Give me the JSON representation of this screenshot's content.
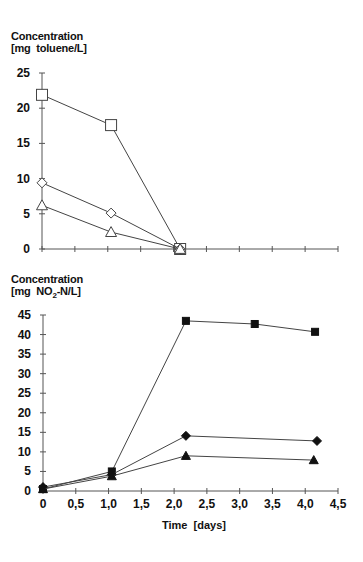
{
  "chart_data": [
    {
      "type": "line",
      "title": "",
      "ylabel": "Concentration [mg toluene/L]",
      "ylabel_line1": "Concentration",
      "ylabel_line2": "[mg  toluene/L]",
      "xlabel": "",
      "xlim": [
        0,
        4.5
      ],
      "ylim": [
        0,
        25
      ],
      "yticks": [
        0,
        5,
        10,
        15,
        20,
        25
      ],
      "xticks": [
        0,
        0.5,
        1.0,
        1.5,
        2.0,
        2.5,
        3.0,
        3.5,
        4.0,
        4.5
      ],
      "x_tick_labels_shown": false,
      "grid": false,
      "legend": null,
      "series": [
        {
          "name": "open-square",
          "marker": "square-open",
          "x": [
            0,
            1.05,
            2.1
          ],
          "y": [
            21.9,
            17.6,
            0
          ]
        },
        {
          "name": "open-diamond",
          "marker": "diamond-open",
          "x": [
            0,
            1.05,
            2.1
          ],
          "y": [
            9.4,
            5.1,
            0
          ]
        },
        {
          "name": "open-triangle",
          "marker": "triangle-open",
          "x": [
            0,
            1.05,
            2.1
          ],
          "y": [
            6.2,
            2.4,
            0
          ]
        }
      ]
    },
    {
      "type": "line",
      "title": "",
      "ylabel": "Concentration [mg NO2-N/L]",
      "ylabel_line1": "Concentration",
      "ylabel_line2_a": "[mg  NO",
      "ylabel_line2_sub": "2",
      "ylabel_line2_b": "-N/L]",
      "xlabel": "Time  [days]",
      "xlim": [
        0,
        4.5
      ],
      "ylim": [
        0,
        45
      ],
      "yticks": [
        0,
        5,
        10,
        15,
        20,
        25,
        30,
        35,
        40,
        45
      ],
      "xticks": [
        0,
        0.5,
        1.0,
        1.5,
        2.0,
        2.5,
        3.0,
        3.5,
        4.0,
        4.5
      ],
      "xtick_labels": [
        "0",
        "0,5",
        "1,0",
        "1,5",
        "2,0",
        "2,5",
        "3,0",
        "3,5",
        "4,0",
        "4,5"
      ],
      "grid": false,
      "legend": null,
      "series": [
        {
          "name": "filled-square",
          "marker": "square-filled",
          "x": [
            0,
            1.05,
            2.18,
            3.23,
            4.15
          ],
          "y": [
            0.5,
            5.0,
            43.5,
            42.7,
            40.7
          ]
        },
        {
          "name": "filled-diamond",
          "marker": "diamond-filled",
          "x": [
            0,
            1.05,
            2.18,
            4.18
          ],
          "y": [
            1.0,
            4.2,
            14.1,
            12.8
          ]
        },
        {
          "name": "filled-triangle",
          "marker": "triangle-filled",
          "x": [
            0,
            1.05,
            2.18,
            4.13
          ],
          "y": [
            0.5,
            3.8,
            9.0,
            7.9
          ]
        }
      ]
    }
  ]
}
